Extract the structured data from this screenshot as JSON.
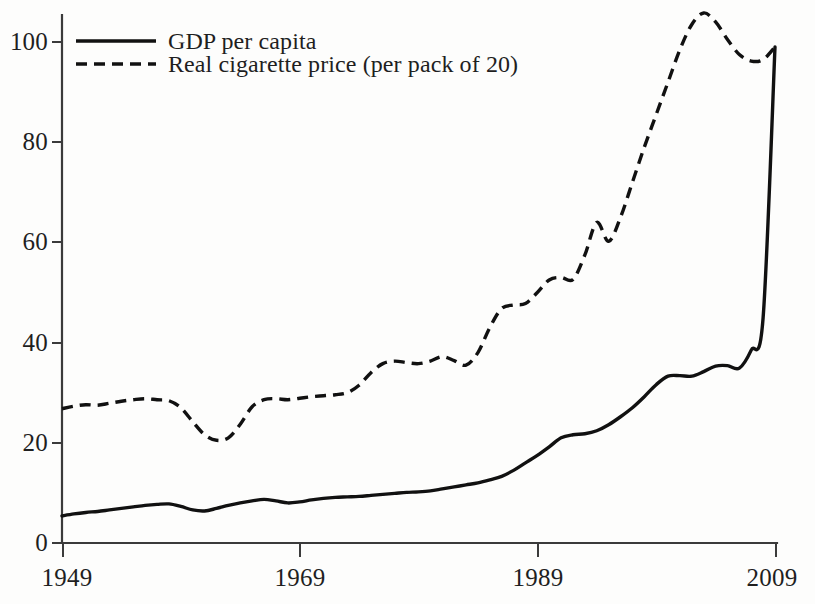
{
  "chart_data": {
    "type": "line",
    "title": "",
    "subtitle": "",
    "xlabel": "",
    "ylabel": "",
    "xlim": [
      1949,
      2009
    ],
    "ylim": [
      0,
      100
    ],
    "xticks": [
      "1949",
      "1969",
      "1989",
      "2009"
    ],
    "xtick_values": [
      1949,
      1969,
      1989,
      2009
    ],
    "yticks": [
      "0",
      "20",
      "40",
      "60",
      "80",
      "100"
    ],
    "ytick_values": [
      0,
      20,
      40,
      60,
      80,
      100
    ],
    "grid": false,
    "legend_position": "top-left",
    "line_color": "#111111",
    "axis_color": "#3b3b3b",
    "background_color": "#fdfdfc",
    "x": [
      1949,
      1950,
      1951,
      1952,
      1953,
      1954,
      1955,
      1956,
      1957,
      1958,
      1959,
      1960,
      1961,
      1962,
      1963,
      1964,
      1965,
      1966,
      1967,
      1968,
      1969,
      1970,
      1971,
      1972,
      1973,
      1974,
      1975,
      1976,
      1977,
      1978,
      1979,
      1980,
      1981,
      1982,
      1983,
      1984,
      1985,
      1986,
      1987,
      1988,
      1989,
      1990,
      1991,
      1992,
      1993,
      1994,
      1995,
      1996,
      1997,
      1998,
      1999,
      2000,
      2001,
      2002,
      2003,
      2004,
      2005,
      2006,
      2007,
      2008,
      2009
    ],
    "series": [
      {
        "name": "GDP per capita",
        "style": "solid",
        "values": [
          5.4,
          5.8,
          6.1,
          6.3,
          6.6,
          6.9,
          7.2,
          7.5,
          7.7,
          7.8,
          7.3,
          6.6,
          6.4,
          6.9,
          7.5,
          8.0,
          8.4,
          8.7,
          8.4,
          8.0,
          8.2,
          8.6,
          8.9,
          9.1,
          9.2,
          9.3,
          9.5,
          9.7,
          9.9,
          10.1,
          10.2,
          10.4,
          10.8,
          11.2,
          11.6,
          12.0,
          12.6,
          13.3,
          14.5,
          16.0,
          17.5,
          19.2,
          21.0,
          21.6,
          21.8,
          22.4,
          23.6,
          25.2,
          27.0,
          29.2,
          31.6,
          33.3,
          33.4,
          33.3,
          34.2,
          35.3,
          35.4,
          34.9,
          38.5,
          45.0,
          99.0
        ]
      },
      {
        "name": "Real cigarette price (per pack of 20)",
        "style": "dashed",
        "values": [
          26.8,
          27.3,
          27.6,
          27.5,
          27.9,
          28.3,
          28.6,
          28.8,
          28.6,
          28.4,
          27.0,
          24.2,
          21.6,
          20.5,
          21.0,
          23.7,
          27.2,
          28.6,
          28.8,
          28.6,
          28.9,
          29.2,
          29.4,
          29.6,
          30.0,
          31.5,
          34.0,
          35.8,
          36.3,
          36.0,
          35.8,
          36.3,
          37.2,
          36.4,
          35.5,
          38.0,
          43.0,
          46.8,
          47.5,
          47.8,
          50.0,
          52.5,
          53.0,
          52.6,
          57.5,
          64.0,
          60.2,
          65.0,
          72.0,
          79.0,
          85.5,
          92.0,
          98.5,
          103.5,
          105.8,
          104.0,
          100.5,
          97.5,
          96.2,
          96.5,
          99.0
        ]
      }
    ]
  },
  "legend": {
    "entries": [
      {
        "label": "GDP per capita",
        "style": "solid"
      },
      {
        "label": "Real cigarette price (per pack of 20)",
        "style": "dashed"
      }
    ]
  },
  "axes": {
    "y": {
      "labels": [
        "100",
        "80",
        "60",
        "40",
        "20",
        "0"
      ]
    },
    "x": {
      "labels": [
        "1949",
        "1969",
        "1989",
        "2009"
      ]
    }
  }
}
